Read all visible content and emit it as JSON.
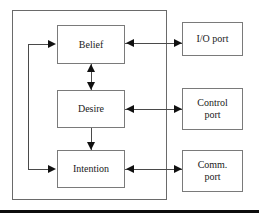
{
  "figure": {
    "type": "block-diagram",
    "width": 259,
    "height": 218
  },
  "colors": {
    "background": "#ffffff",
    "box_border": "#7a7a7a",
    "container_border": "#6a6a6a",
    "connector": "#4a4a4a",
    "arrowhead": "#111111",
    "rule": "#0d0d0d",
    "text": "#1a1a1a"
  },
  "container": {
    "label": "agent-boundary"
  },
  "nodes": [
    {
      "id": "belief",
      "label": "Belief"
    },
    {
      "id": "desire",
      "label": "Desire"
    },
    {
      "id": "intention",
      "label": "Intention"
    }
  ],
  "ports": [
    {
      "id": "io",
      "line1": "I/O port",
      "line2": ""
    },
    {
      "id": "control",
      "line1": "Control",
      "line2": "port"
    },
    {
      "id": "comm",
      "line1": "Comm.",
      "line2": "port"
    }
  ],
  "connectors": [
    {
      "id": "belief-io",
      "from": "belief",
      "to": "io",
      "direction": "bidirectional",
      "orientation": "horizontal"
    },
    {
      "id": "desire-control",
      "from": "desire",
      "to": "control",
      "direction": "bidirectional",
      "orientation": "horizontal"
    },
    {
      "id": "intention-comm",
      "from": "intention",
      "to": "comm",
      "direction": "bidirectional",
      "orientation": "horizontal"
    },
    {
      "id": "belief-desire",
      "from": "belief",
      "to": "desire",
      "direction": "bidirectional",
      "orientation": "vertical"
    },
    {
      "id": "desire-intention",
      "from": "desire",
      "to": "intention",
      "direction": "forward",
      "orientation": "vertical"
    },
    {
      "id": "feedback-belief",
      "from": "rail",
      "to": "belief",
      "direction": "forward",
      "orientation": "horizontal"
    },
    {
      "id": "feedback-intention",
      "from": "rail",
      "to": "intention",
      "direction": "forward",
      "orientation": "horizontal"
    }
  ],
  "rule": {
    "label": "bottom-divider-rule"
  }
}
